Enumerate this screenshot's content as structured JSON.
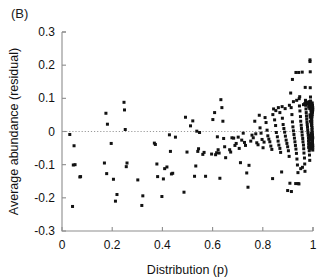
{
  "panel": {
    "label": "(B)"
  },
  "chart_data": {
    "type": "scatter",
    "title": "",
    "xlabel": "Distribution (p)",
    "ylabel": "Average abundance (residual)",
    "xlim": [
      0,
      1
    ],
    "ylim": [
      -0.3,
      0.3
    ],
    "xticks": [
      0,
      0.2,
      0.4,
      0.6,
      0.8,
      1
    ],
    "xticklabels": [
      "0",
      "0.2",
      "0.4",
      "0.6",
      "0.8",
      "1"
    ],
    "yticks": [
      -0.3,
      -0.2,
      -0.1,
      0,
      0.1,
      0.2,
      0.3
    ],
    "yticklabels": [
      "-0.3",
      "-0.2",
      "-0.1",
      "0",
      "0.1",
      "0.2",
      "0.3"
    ],
    "grid": false,
    "legend": null,
    "marker": {
      "shape": "square",
      "size_px": 3,
      "color": "#121212"
    },
    "annotations": [
      {
        "type": "hline",
        "y": 0,
        "style": "dotted",
        "color": "#9a9a9a"
      }
    ],
    "points": [
      [
        0.031,
        -0.009
      ],
      [
        0.042,
        -0.226
      ],
      [
        0.045,
        -0.101
      ],
      [
        0.048,
        -0.043
      ],
      [
        0.052,
        -0.1
      ],
      [
        0.071,
        -0.137
      ],
      [
        0.074,
        -0.136
      ],
      [
        0.169,
        -0.095
      ],
      [
        0.175,
        0.055
      ],
      [
        0.178,
        -0.127
      ],
      [
        0.181,
        0.022
      ],
      [
        0.196,
        -0.036
      ],
      [
        0.205,
        -0.144
      ],
      [
        0.213,
        -0.21
      ],
      [
        0.219,
        -0.19
      ],
      [
        0.247,
        0.088
      ],
      [
        0.249,
        0.065
      ],
      [
        0.252,
        0.006
      ],
      [
        0.256,
        -0.106
      ],
      [
        0.259,
        -0.095
      ],
      [
        0.302,
        -0.146
      ],
      [
        0.318,
        -0.223
      ],
      [
        0.322,
        -0.194
      ],
      [
        0.368,
        -0.035
      ],
      [
        0.372,
        -0.039
      ],
      [
        0.378,
        -0.098
      ],
      [
        0.381,
        -0.136
      ],
      [
        0.398,
        -0.196
      ],
      [
        0.404,
        -0.143
      ],
      [
        0.409,
        -0.112
      ],
      [
        0.418,
        -0.107
      ],
      [
        0.428,
        -0.01
      ],
      [
        0.432,
        -0.06
      ],
      [
        0.436,
        -0.128
      ],
      [
        0.441,
        -0.126
      ],
      [
        0.452,
        -0.017
      ],
      [
        0.486,
        -0.183
      ],
      [
        0.492,
        0.043
      ],
      [
        0.498,
        -0.062
      ],
      [
        0.512,
        0.017
      ],
      [
        0.521,
        0.032
      ],
      [
        0.528,
        -0.135
      ],
      [
        0.533,
        -0.104
      ],
      [
        0.537,
        0.001
      ],
      [
        0.541,
        -0.06
      ],
      [
        0.544,
        -0.052
      ],
      [
        0.548,
        -0.003
      ],
      [
        0.561,
        -0.069
      ],
      [
        0.566,
        -0.063
      ],
      [
        0.572,
        -0.135
      ],
      [
        0.596,
        -0.068
      ],
      [
        0.601,
        0.036
      ],
      [
        0.608,
        0.057
      ],
      [
        0.612,
        -0.07
      ],
      [
        0.616,
        -0.064
      ],
      [
        0.619,
        -0.016
      ],
      [
        0.622,
        -0.055
      ],
      [
        0.626,
        -0.065
      ],
      [
        0.629,
        -0.141
      ],
      [
        0.633,
        0.096
      ],
      [
        0.637,
        0.072
      ],
      [
        0.641,
        0.031
      ],
      [
        0.644,
        -0.021
      ],
      [
        0.648,
        -0.046
      ],
      [
        0.652,
        -0.079
      ],
      [
        0.668,
        -0.055
      ],
      [
        0.672,
        -0.062
      ],
      [
        0.677,
        -0.019
      ],
      [
        0.684,
        -0.02
      ],
      [
        0.689,
        -0.042
      ],
      [
        0.694,
        -0.036
      ],
      [
        0.702,
        -0.017
      ],
      [
        0.706,
        -0.051
      ],
      [
        0.711,
        -0.094
      ],
      [
        0.716,
        -0.026
      ],
      [
        0.722,
        -0.005
      ],
      [
        0.727,
        -0.033
      ],
      [
        0.731,
        -0.042
      ],
      [
        0.736,
        -0.125
      ],
      [
        0.741,
        -0.168
      ],
      [
        0.745,
        -0.102
      ],
      [
        0.752,
        -0.029
      ],
      [
        0.757,
        -0.011
      ],
      [
        0.762,
        -0.019
      ],
      [
        0.768,
        0.031
      ],
      [
        0.772,
        -0.007
      ],
      [
        0.776,
        -0.034
      ],
      [
        0.781,
        -0.04
      ],
      [
        0.786,
        0.049
      ],
      [
        0.789,
        0.011
      ],
      [
        0.793,
        -0.005
      ],
      [
        0.797,
        -0.024
      ],
      [
        0.801,
        -0.049
      ],
      [
        0.805,
        -0.032
      ],
      [
        0.809,
        0.042
      ],
      [
        0.813,
        0.027
      ],
      [
        0.817,
        0.004
      ],
      [
        0.82,
        -0.013
      ],
      [
        0.824,
        -0.023
      ],
      [
        0.828,
        -0.031
      ],
      [
        0.832,
        -0.044
      ],
      [
        0.836,
        -0.054
      ],
      [
        0.839,
        -0.142
      ],
      [
        0.843,
        0.068
      ],
      [
        0.847,
        0.035
      ],
      [
        0.851,
        0.018
      ],
      [
        0.854,
        -0.003
      ],
      [
        0.858,
        -0.016
      ],
      [
        0.861,
        -0.029
      ],
      [
        0.864,
        -0.041
      ],
      [
        0.868,
        -0.051
      ],
      [
        0.871,
        -0.063
      ],
      [
        0.875,
        -0.122
      ],
      [
        0.878,
        0.04
      ],
      [
        0.881,
        0.021
      ],
      [
        0.884,
        0.009
      ],
      [
        0.887,
        -0.002
      ],
      [
        0.89,
        -0.014
      ],
      [
        0.893,
        -0.026
      ],
      [
        0.896,
        -0.036
      ],
      [
        0.899,
        -0.046
      ],
      [
        0.902,
        -0.058
      ],
      [
        0.905,
        -0.075
      ],
      [
        0.908,
        -0.156
      ],
      [
        0.911,
        0.116
      ],
      [
        0.913,
        0.072
      ],
      [
        0.916,
        0.051
      ],
      [
        0.918,
        0.029
      ],
      [
        0.92,
        0.014
      ],
      [
        0.922,
        0.002
      ],
      [
        0.924,
        -0.009
      ],
      [
        0.926,
        -0.02
      ],
      [
        0.928,
        -0.031
      ],
      [
        0.93,
        -0.042
      ],
      [
        0.932,
        -0.053
      ],
      [
        0.934,
        -0.066
      ],
      [
        0.936,
        -0.083
      ],
      [
        0.938,
        -0.101
      ],
      [
        0.94,
        -0.124
      ],
      [
        0.941,
        -0.157
      ],
      [
        0.943,
        0.178
      ],
      [
        0.945,
        0.099
      ],
      [
        0.946,
        0.077
      ],
      [
        0.948,
        0.062
      ],
      [
        0.95,
        0.045
      ],
      [
        0.951,
        0.031
      ],
      [
        0.953,
        0.019
      ],
      [
        0.954,
        0.009
      ],
      [
        0.956,
        -0.001
      ],
      [
        0.957,
        -0.011
      ],
      [
        0.959,
        -0.021
      ],
      [
        0.96,
        -0.031
      ],
      [
        0.962,
        -0.041
      ],
      [
        0.963,
        -0.052
      ],
      [
        0.964,
        -0.065
      ],
      [
        0.966,
        -0.08
      ],
      [
        0.967,
        -0.098
      ],
      [
        0.968,
        -0.12
      ],
      [
        0.969,
        0.133
      ],
      [
        0.97,
        0.094
      ],
      [
        0.971,
        0.079
      ],
      [
        0.972,
        0.068
      ],
      [
        0.973,
        0.057
      ],
      [
        0.974,
        0.047
      ],
      [
        0.975,
        0.038
      ],
      [
        0.976,
        0.029
      ],
      [
        0.977,
        0.021
      ],
      [
        0.978,
        0.013
      ],
      [
        0.979,
        0.005
      ],
      [
        0.98,
        -0.003
      ],
      [
        0.981,
        -0.011
      ],
      [
        0.982,
        -0.019
      ],
      [
        0.982,
        -0.028
      ],
      [
        0.983,
        -0.037
      ],
      [
        0.984,
        -0.047
      ],
      [
        0.985,
        -0.058
      ],
      [
        0.986,
        -0.071
      ],
      [
        0.987,
        -0.087
      ],
      [
        0.988,
        0.211
      ],
      [
        0.988,
        0.216
      ],
      [
        0.989,
        0.18
      ],
      [
        0.989,
        0.132
      ],
      [
        0.99,
        0.104
      ],
      [
        0.99,
        0.092
      ],
      [
        0.991,
        0.084
      ],
      [
        0.991,
        0.077
      ],
      [
        0.992,
        0.07
      ],
      [
        0.992,
        0.064
      ],
      [
        0.993,
        0.058
      ],
      [
        0.993,
        0.052
      ],
      [
        0.994,
        0.046
      ],
      [
        0.994,
        0.04
      ],
      [
        0.994,
        0.034
      ],
      [
        0.995,
        0.029
      ],
      [
        0.995,
        0.023
      ],
      [
        0.995,
        0.018
      ],
      [
        0.996,
        0.012
      ],
      [
        0.996,
        0.007
      ],
      [
        0.996,
        0.002
      ],
      [
        0.997,
        -0.003
      ],
      [
        0.997,
        -0.008
      ],
      [
        0.997,
        -0.013
      ],
      [
        0.998,
        -0.018
      ],
      [
        0.998,
        -0.023
      ],
      [
        0.998,
        -0.029
      ],
      [
        0.998,
        -0.035
      ],
      [
        0.999,
        -0.041
      ],
      [
        0.999,
        -0.048
      ],
      [
        0.999,
        -0.056
      ],
      [
        0.986,
        0.09
      ],
      [
        0.986,
        0.083
      ],
      [
        0.987,
        0.076
      ],
      [
        0.987,
        0.069
      ],
      [
        0.984,
        0.086
      ],
      [
        0.985,
        0.079
      ],
      [
        0.983,
        0.074
      ],
      [
        0.982,
        0.085
      ],
      [
        0.979,
        0.083
      ],
      [
        0.977,
        0.087
      ],
      [
        0.975,
        0.084
      ],
      [
        0.973,
        0.089
      ],
      [
        0.971,
        0.087
      ],
      [
        0.967,
        0.084
      ],
      [
        0.962,
        0.081
      ],
      [
        0.958,
        -0.108
      ],
      [
        0.951,
        -0.112
      ],
      [
        0.944,
        -0.158
      ],
      [
        0.931,
        -0.157
      ],
      [
        0.914,
        -0.181
      ],
      [
        0.899,
        -0.178
      ],
      [
        0.862,
        0.072
      ],
      [
        0.877,
        0.075
      ],
      [
        0.889,
        0.069
      ],
      [
        0.906,
        0.079
      ],
      [
        0.922,
        0.09
      ],
      [
        0.935,
        0.094
      ],
      [
        0.947,
        0.105
      ],
      [
        0.918,
        0.157
      ],
      [
        0.932,
        0.178
      ],
      [
        0.957,
        0.179
      ],
      [
        0.868,
        0.057
      ],
      [
        0.852,
        0.063
      ],
      [
        0.84,
        0.051
      ],
      [
        0.993,
        0.026
      ],
      [
        0.994,
        0.019
      ],
      [
        0.995,
        0.035
      ],
      [
        0.996,
        0.044
      ],
      [
        0.997,
        0.051
      ],
      [
        0.998,
        0.058
      ],
      [
        0.999,
        0.065
      ],
      [
        0.999,
        0.072
      ],
      [
        0.998,
        0.079
      ],
      [
        0.997,
        0.086
      ],
      [
        0.996,
        0.074
      ],
      [
        0.995,
        0.061
      ],
      [
        0.994,
        0.055
      ],
      [
        0.993,
        0.068
      ],
      [
        0.992,
        0.082
      ],
      [
        0.991,
        0.089
      ],
      [
        0.99,
        0.031
      ],
      [
        0.989,
        0.043
      ],
      [
        0.988,
        0.05
      ],
      [
        0.999,
        -0.019
      ],
      [
        0.998,
        -0.012
      ],
      [
        0.997,
        -0.025
      ],
      [
        0.996,
        -0.033
      ],
      [
        0.995,
        -0.043
      ],
      [
        0.994,
        -0.051
      ],
      [
        0.993,
        -0.006
      ],
      [
        0.992,
        -0.015
      ],
      [
        0.991,
        -0.024
      ],
      [
        0.99,
        -0.036
      ],
      [
        0.989,
        -0.045
      ],
      [
        0.988,
        -0.053
      ],
      [
        0.987,
        -0.012
      ],
      [
        0.986,
        -0.022
      ],
      [
        0.985,
        -0.031
      ],
      [
        0.984,
        -0.039
      ],
      [
        0.983,
        -0.048
      ]
    ]
  }
}
